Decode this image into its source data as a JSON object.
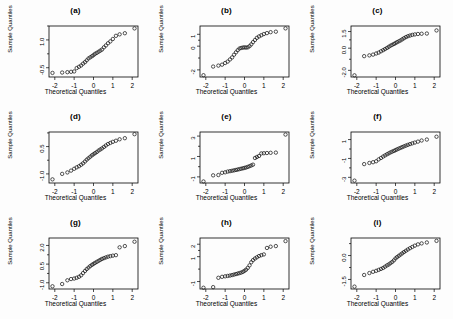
{
  "figure": {
    "layout": {
      "rows": 3,
      "cols": 3
    },
    "axis_titles": {
      "x": "Theoretical Quantiles",
      "y": "Sample Quantiles"
    },
    "marker": "open-circle",
    "colors": {
      "marker_stroke": "#1a1a1a",
      "axis": "#000000",
      "background": "#fdfdfd"
    }
  },
  "chart_data": [
    {
      "type": "scatter",
      "title": "(a)",
      "xlabel": "Theoretical Quantiles",
      "ylabel": "Sample Quantiles",
      "xlim": [
        -2.3,
        2.3
      ],
      "ylim": [
        -1.0,
        1.75
      ],
      "xticks": [
        -2,
        -1,
        0,
        1,
        2
      ],
      "yticks": [
        -0.5,
        1.0
      ],
      "ytick_labels": [
        "-0.5",
        "1.0"
      ],
      "grid": false,
      "x": [
        -2.12,
        -1.62,
        -1.35,
        -1.16,
        -1.0,
        -0.87,
        -0.75,
        -0.64,
        -0.54,
        -0.44,
        -0.35,
        -0.26,
        -0.17,
        -0.08,
        0.0,
        0.08,
        0.17,
        0.26,
        0.35,
        0.44,
        0.54,
        0.64,
        0.75,
        0.87,
        1.0,
        1.16,
        1.35,
        1.62,
        2.12
      ],
      "y": [
        -0.78,
        -0.76,
        -0.74,
        -0.72,
        -0.7,
        -0.52,
        -0.45,
        -0.38,
        -0.28,
        -0.2,
        -0.1,
        0.0,
        0.06,
        0.12,
        0.18,
        0.25,
        0.3,
        0.36,
        0.42,
        0.48,
        0.6,
        0.7,
        0.82,
        0.92,
        1.05,
        1.22,
        1.3,
        1.36,
        1.62
      ]
    },
    {
      "type": "scatter",
      "title": "(b)",
      "xlabel": "Theoretical Quantiles",
      "ylabel": "Sample Quantiles",
      "xlim": [
        -2.3,
        2.3
      ],
      "ylim": [
        -2.6,
        1.7
      ],
      "xticks": [
        -2,
        -1,
        0,
        1,
        2
      ],
      "yticks": [
        -2,
        0,
        1
      ],
      "ytick_labels": [
        "-2",
        "0",
        "1"
      ],
      "grid": false,
      "x": [
        -2.12,
        -1.62,
        -1.35,
        -1.16,
        -1.0,
        -0.87,
        -0.75,
        -0.64,
        -0.54,
        -0.44,
        -0.35,
        -0.26,
        -0.17,
        -0.08,
        0.0,
        0.08,
        0.17,
        0.26,
        0.35,
        0.44,
        0.54,
        0.64,
        0.75,
        0.87,
        1.0,
        1.16,
        1.35,
        1.62,
        2.12
      ],
      "y": [
        -2.45,
        -1.72,
        -1.64,
        -1.56,
        -1.42,
        -1.3,
        -1.12,
        -0.95,
        -0.72,
        -0.52,
        -0.34,
        -0.2,
        -0.15,
        -0.12,
        -0.1,
        -0.12,
        -0.1,
        0.0,
        0.15,
        0.34,
        0.52,
        0.7,
        0.82,
        0.92,
        1.02,
        1.1,
        1.18,
        1.22,
        1.5
      ]
    },
    {
      "type": "scatter",
      "title": "(c)",
      "xlabel": "Theoretical Quantiles",
      "ylabel": "Sample Quantiles",
      "xlim": [
        -2.3,
        2.3
      ],
      "ylim": [
        -2.6,
        2.0
      ],
      "xticks": [
        -2,
        -1,
        0,
        1,
        2
      ],
      "yticks": [
        -2.0,
        0.0,
        1.5
      ],
      "ytick_labels": [
        "-2.0",
        "0.0",
        "1.5"
      ],
      "grid": false,
      "x": [
        -2.12,
        -1.62,
        -1.35,
        -1.16,
        -1.0,
        -0.87,
        -0.75,
        -0.64,
        -0.54,
        -0.44,
        -0.35,
        -0.26,
        -0.17,
        -0.08,
        0.0,
        0.08,
        0.17,
        0.26,
        0.35,
        0.44,
        0.54,
        0.64,
        0.75,
        0.87,
        1.0,
        1.16,
        1.35,
        1.62,
        2.12
      ],
      "y": [
        -2.45,
        -0.72,
        -0.65,
        -0.58,
        -0.48,
        -0.4,
        -0.28,
        -0.18,
        -0.08,
        0.02,
        0.12,
        0.22,
        0.3,
        0.38,
        0.46,
        0.54,
        0.62,
        0.7,
        0.8,
        0.9,
        1.0,
        1.08,
        1.14,
        1.2,
        1.24,
        1.28,
        1.3,
        1.32,
        1.6
      ]
    },
    {
      "type": "scatter",
      "title": "(d)",
      "xlabel": "Theoretical Quantiles",
      "ylabel": "Sample Quantiles",
      "xlim": [
        -2.3,
        2.3
      ],
      "ylim": [
        -1.5,
        1.3
      ],
      "xticks": [
        -2,
        -1,
        0,
        1,
        2
      ],
      "yticks": [
        -1.0,
        0.5
      ],
      "ytick_labels": [
        "-1.0",
        "0.5"
      ],
      "grid": false,
      "x": [
        -2.12,
        -1.62,
        -1.35,
        -1.16,
        -1.0,
        -0.87,
        -0.75,
        -0.64,
        -0.54,
        -0.44,
        -0.35,
        -0.26,
        -0.17,
        -0.08,
        0.0,
        0.08,
        0.17,
        0.26,
        0.35,
        0.44,
        0.54,
        0.64,
        0.75,
        0.87,
        1.0,
        1.16,
        1.35,
        1.62,
        2.12
      ],
      "y": [
        -1.3,
        -1.0,
        -0.92,
        -0.82,
        -0.72,
        -0.64,
        -0.58,
        -0.5,
        -0.42,
        -0.32,
        -0.22,
        -0.14,
        -0.06,
        0.02,
        0.08,
        0.14,
        0.2,
        0.28,
        0.34,
        0.4,
        0.48,
        0.56,
        0.64,
        0.7,
        0.76,
        0.82,
        0.9,
        0.96,
        1.18
      ]
    },
    {
      "type": "scatter",
      "title": "(e)",
      "xlabel": "Theoretical Quantiles",
      "ylabel": "Sample Quantiles",
      "xlim": [
        -2.3,
        2.3
      ],
      "ylim": [
        -1.6,
        3.4
      ],
      "xticks": [
        -2,
        -1,
        0,
        1,
        2
      ],
      "yticks": [
        -1,
        1,
        3
      ],
      "ytick_labels": [
        "-1",
        "1",
        "3"
      ],
      "grid": false,
      "x": [
        -2.12,
        -1.62,
        -1.35,
        -1.16,
        -1.0,
        -0.87,
        -0.75,
        -0.64,
        -0.54,
        -0.44,
        -0.35,
        -0.26,
        -0.17,
        -0.08,
        0.0,
        0.08,
        0.17,
        0.26,
        0.35,
        0.44,
        0.54,
        0.64,
        0.75,
        0.87,
        1.0,
        1.16,
        1.35,
        1.62,
        2.12
      ],
      "y": [
        -1.45,
        -0.85,
        -0.82,
        -0.6,
        -0.55,
        -0.48,
        -0.44,
        -0.4,
        -0.36,
        -0.32,
        -0.28,
        -0.24,
        -0.2,
        -0.16,
        -0.12,
        -0.08,
        -0.02,
        0.05,
        0.12,
        0.2,
        0.85,
        0.95,
        1.05,
        1.3,
        1.32,
        1.34,
        1.36,
        1.38,
        3.15
      ]
    },
    {
      "type": "scatter",
      "title": "(f)",
      "xlabel": "Theoretical Quantiles",
      "ylabel": "Sample Quantiles",
      "xlim": [
        -2.3,
        2.3
      ],
      "ylim": [
        -3.6,
        1.8
      ],
      "xticks": [
        -2,
        -1,
        0,
        1,
        2
      ],
      "yticks": [
        -3,
        -1,
        1
      ],
      "ytick_labels": [
        "-3",
        "-1",
        "1"
      ],
      "grid": false,
      "x": [
        -2.12,
        -1.62,
        -1.35,
        -1.16,
        -1.0,
        -0.87,
        -0.75,
        -0.64,
        -0.54,
        -0.44,
        -0.35,
        -0.26,
        -0.17,
        -0.08,
        0.0,
        0.08,
        0.17,
        0.26,
        0.35,
        0.44,
        0.54,
        0.64,
        0.75,
        0.87,
        1.0,
        1.16,
        1.35,
        1.62,
        2.12
      ],
      "y": [
        -3.35,
        -1.6,
        -1.48,
        -1.4,
        -1.3,
        -1.1,
        -0.95,
        -0.8,
        -0.68,
        -0.56,
        -0.46,
        -0.36,
        -0.28,
        -0.2,
        -0.12,
        -0.04,
        0.04,
        0.12,
        0.2,
        0.28,
        0.36,
        0.44,
        0.52,
        0.6,
        0.68,
        0.78,
        0.9,
        1.0,
        1.3
      ]
    },
    {
      "type": "scatter",
      "title": "(g)",
      "xlabel": "Theoretical Quantiles",
      "ylabel": "Sample Quantiles",
      "xlim": [
        -2.3,
        2.3
      ],
      "ylim": [
        -1.5,
        2.6
      ],
      "xticks": [
        -2,
        -1,
        0,
        1,
        2
      ],
      "yticks": [
        -1.0,
        0.5,
        2.0
      ],
      "ytick_labels": [
        "-1.0",
        "0.5",
        "2.0"
      ],
      "grid": false,
      "x": [
        -2.12,
        -1.62,
        -1.35,
        -1.16,
        -1.0,
        -0.87,
        -0.75,
        -0.64,
        -0.54,
        -0.44,
        -0.35,
        -0.26,
        -0.17,
        -0.08,
        0.0,
        0.08,
        0.17,
        0.26,
        0.35,
        0.44,
        0.54,
        0.64,
        0.75,
        0.87,
        1.0,
        1.16,
        1.35,
        1.62,
        2.12
      ],
      "y": [
        -1.28,
        -1.1,
        -0.8,
        -0.7,
        -0.66,
        -0.6,
        -0.52,
        -0.4,
        -0.22,
        -0.05,
        0.1,
        0.22,
        0.34,
        0.44,
        0.52,
        0.6,
        0.68,
        0.76,
        0.84,
        0.92,
        0.98,
        1.04,
        1.1,
        1.14,
        1.18,
        1.22,
        1.85,
        1.95,
        2.3
      ]
    },
    {
      "type": "scatter",
      "title": "(h)",
      "xlabel": "Theoretical Quantiles",
      "ylabel": "Sample Quantiles",
      "xlim": [
        -2.3,
        2.3
      ],
      "ylim": [
        -1.6,
        2.5
      ],
      "xticks": [
        -2,
        -1,
        0,
        1,
        2
      ],
      "yticks": [
        -1,
        1,
        2
      ],
      "ytick_labels": [
        "-1",
        "1",
        "2"
      ],
      "grid": false,
      "x": [
        -2.12,
        -1.62,
        -1.35,
        -1.16,
        -1.0,
        -0.87,
        -0.75,
        -0.64,
        -0.54,
        -0.44,
        -0.35,
        -0.26,
        -0.17,
        -0.08,
        0.0,
        0.08,
        0.17,
        0.26,
        0.35,
        0.44,
        0.54,
        0.64,
        0.75,
        0.87,
        1.0,
        1.16,
        1.35,
        1.62,
        2.12
      ],
      "y": [
        -1.5,
        -1.45,
        -0.7,
        -0.62,
        -0.58,
        -0.55,
        -0.52,
        -0.48,
        -0.44,
        -0.4,
        -0.36,
        -0.32,
        -0.28,
        -0.22,
        -0.14,
        -0.05,
        0.1,
        0.3,
        0.55,
        0.72,
        0.85,
        0.95,
        1.05,
        1.12,
        1.18,
        1.7,
        1.8,
        1.85,
        2.25
      ]
    },
    {
      "type": "scatter",
      "title": "(i)",
      "xlabel": "Theoretical Quantiles",
      "ylabel": "Sample Quantiles",
      "xlim": [
        -2.3,
        2.3
      ],
      "ylim": [
        -2.1,
        1.1
      ],
      "xticks": [
        -2,
        -1,
        0,
        1,
        2
      ],
      "yticks": [
        -1.5,
        0.0
      ],
      "ytick_labels": [
        "-1.5",
        "0.0"
      ],
      "grid": false,
      "x": [
        -2.12,
        -1.62,
        -1.35,
        -1.16,
        -1.0,
        -0.87,
        -0.75,
        -0.64,
        -0.54,
        -0.44,
        -0.35,
        -0.26,
        -0.17,
        -0.08,
        0.0,
        0.08,
        0.17,
        0.26,
        0.35,
        0.44,
        0.54,
        0.64,
        0.75,
        0.87,
        1.0,
        1.16,
        1.35,
        1.62,
        2.12
      ],
      "y": [
        -1.95,
        -1.22,
        -1.1,
        -1.02,
        -0.96,
        -0.9,
        -0.84,
        -0.78,
        -0.7,
        -0.62,
        -0.56,
        -0.48,
        -0.4,
        -0.3,
        -0.18,
        -0.1,
        -0.02,
        0.06,
        0.14,
        0.22,
        0.3,
        0.38,
        0.46,
        0.54,
        0.62,
        0.7,
        0.76,
        0.82,
        0.92
      ]
    }
  ]
}
